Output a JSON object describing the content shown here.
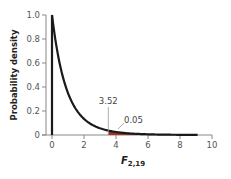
{
  "chart_data": {
    "type": "line",
    "title": "",
    "distribution": "F",
    "df1": 2,
    "df2": 19,
    "xlabel": "F",
    "xlabel_subscript": "2,19",
    "ylabel": "Probability density",
    "xlim": [
      0,
      10
    ],
    "ylim": [
      0,
      1.0
    ],
    "x_ticks": [
      0,
      2,
      4,
      6,
      8,
      10
    ],
    "x_tick_labels": [
      "0",
      "2",
      "4",
      "6",
      "8",
      "10"
    ],
    "y_ticks": [
      0,
      0.2,
      0.4,
      0.6,
      0.8,
      1.0
    ],
    "y_tick_labels": [
      "0",
      "0.2",
      "0.4",
      "0.6",
      "0.8",
      "1.0"
    ],
    "grid": false,
    "curve_x_max": 9.1,
    "x": [
      0,
      0.5,
      1,
      2,
      3,
      3.52,
      4,
      5,
      6,
      8,
      9
    ],
    "values": [
      1.0,
      0.584,
      0.35,
      0.135,
      0.056,
      0.037,
      0.025,
      0.012,
      0.006,
      0.002,
      0.001
    ],
    "vertical_line_at_zero": true,
    "critical_value": 3.52,
    "critical_value_label": "3.52",
    "shaded_area_label": "0.05",
    "shaded_area_start": 3.52,
    "colors": {
      "curve": "#1a1a1a",
      "shade": "#a3341c",
      "axis": "#888888",
      "marker_line": "#999999"
    }
  }
}
